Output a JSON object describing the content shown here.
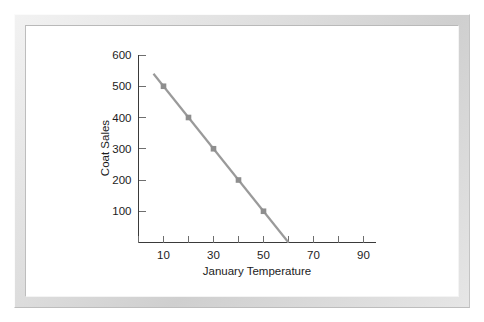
{
  "chart_data": {
    "type": "line",
    "title": "",
    "xlabel": "January Temperature",
    "ylabel": "Coat Sales",
    "xlim": [
      0,
      95
    ],
    "ylim": [
      0,
      600
    ],
    "grid": false,
    "legend": false,
    "x_tick_labels": [
      "10",
      "30",
      "50",
      "70",
      "90"
    ],
    "x_tick_values": [
      10,
      30,
      50,
      70,
      90
    ],
    "x_minor_tick_values": [
      0,
      20,
      40,
      60,
      80
    ],
    "y_tick_labels": [
      "100",
      "200",
      "300",
      "400",
      "500",
      "600"
    ],
    "y_tick_values": [
      100,
      200,
      300,
      400,
      500,
      600
    ],
    "x": [
      10,
      20,
      30,
      40,
      50
    ],
    "values": [
      500,
      400,
      300,
      200,
      100
    ],
    "series": [
      {
        "name": "Coat Sales",
        "color": "#9a9a9a",
        "marker": "square",
        "x": [
          10,
          20,
          30,
          40,
          50
        ],
        "values": [
          500,
          400,
          300,
          200,
          100
        ]
      }
    ],
    "trend_line": {
      "x_start": 6,
      "y_start": 540,
      "x_end": 60,
      "y_end": 0,
      "slope": -10,
      "intercept": 600,
      "x_intercept": 60
    }
  },
  "figure": {
    "y_axis_title": "Coat Sales",
    "x_axis_title": "January Temperature"
  }
}
